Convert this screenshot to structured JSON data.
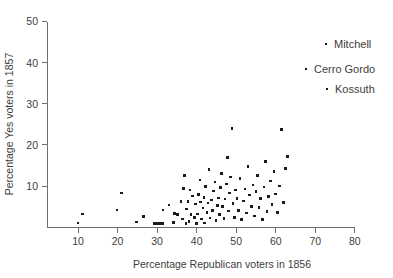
{
  "chart_data": {
    "type": "scatter",
    "title": "",
    "xlabel": "Percentage Republican voters in 1856",
    "ylabel": "Percentage Yes voters in 1857",
    "xlim": [
      5,
      80
    ],
    "ylim": [
      0,
      50
    ],
    "xticks": [
      10,
      20,
      30,
      40,
      50,
      60,
      70,
      80
    ],
    "yticks": [
      10,
      20,
      30,
      40,
      50
    ],
    "xtick_labels": [
      "10",
      "20",
      "30",
      "40",
      "50",
      "60",
      "70",
      "80"
    ],
    "ytick_labels": [
      "10",
      "20",
      "30",
      "40",
      "50"
    ],
    "grid": false,
    "legend": false,
    "marker": "square",
    "marker_color": "#1b1b1b",
    "points": [
      [
        10.0,
        1.0
      ],
      [
        11.2,
        3.2
      ],
      [
        19.9,
        4.2
      ],
      [
        21.0,
        8.3
      ],
      [
        24.8,
        1.2
      ],
      [
        26.5,
        2.6
      ],
      [
        29.4,
        0.9
      ],
      [
        30.0,
        0.9
      ],
      [
        30.6,
        0.9
      ],
      [
        31.3,
        0.9
      ],
      [
        31.5,
        4.2
      ],
      [
        33.0,
        5.4
      ],
      [
        34.2,
        1.1
      ],
      [
        34.4,
        3.3
      ],
      [
        35.2,
        3.0
      ],
      [
        36.0,
        6.2
      ],
      [
        36.4,
        2.0
      ],
      [
        36.6,
        9.4
      ],
      [
        37.0,
        12.5
      ],
      [
        37.3,
        0.9
      ],
      [
        37.5,
        4.4
      ],
      [
        37.8,
        6.3
      ],
      [
        38.1,
        1.3
      ],
      [
        38.3,
        9.0
      ],
      [
        38.6,
        3.1
      ],
      [
        38.9,
        7.6
      ],
      [
        39.4,
        2.4
      ],
      [
        39.7,
        5.6
      ],
      [
        40.0,
        0.9
      ],
      [
        40.2,
        3.2
      ],
      [
        40.5,
        8.0
      ],
      [
        40.8,
        11.5
      ],
      [
        41.0,
        6.1
      ],
      [
        41.2,
        2.0
      ],
      [
        41.6,
        4.6
      ],
      [
        41.9,
        7.2
      ],
      [
        42.0,
        1.0
      ],
      [
        42.3,
        9.9
      ],
      [
        42.6,
        3.6
      ],
      [
        42.9,
        5.9
      ],
      [
        43.1,
        14.0
      ],
      [
        43.4,
        2.2
      ],
      [
        43.7,
        6.6
      ],
      [
        44.0,
        4.0
      ],
      [
        44.3,
        8.8
      ],
      [
        44.6,
        11.0
      ],
      [
        44.9,
        1.6
      ],
      [
        45.2,
        5.2
      ],
      [
        45.5,
        7.1
      ],
      [
        45.8,
        3.0
      ],
      [
        46.0,
        9.6
      ],
      [
        46.3,
        13.0
      ],
      [
        46.6,
        5.0
      ],
      [
        46.9,
        2.1
      ],
      [
        47.2,
        6.8
      ],
      [
        47.5,
        10.5
      ],
      [
        47.8,
        17.0
      ],
      [
        48.0,
        3.9
      ],
      [
        48.3,
        8.3
      ],
      [
        48.6,
        12.2
      ],
      [
        48.9,
        24.0
      ],
      [
        49.2,
        5.7
      ],
      [
        49.5,
        2.3
      ],
      [
        49.8,
        9.0
      ],
      [
        50.2,
        7.0
      ],
      [
        50.6,
        4.1
      ],
      [
        51.0,
        11.8
      ],
      [
        51.4,
        1.9
      ],
      [
        51.8,
        6.4
      ],
      [
        52.2,
        9.3
      ],
      [
        52.6,
        3.4
      ],
      [
        53.0,
        14.8
      ],
      [
        53.4,
        7.8
      ],
      [
        53.8,
        5.0
      ],
      [
        54.2,
        10.2
      ],
      [
        54.6,
        2.7
      ],
      [
        55.0,
        8.6
      ],
      [
        55.4,
        12.6
      ],
      [
        55.8,
        4.8
      ],
      [
        56.2,
        6.9
      ],
      [
        56.6,
        1.8
      ],
      [
        57.0,
        9.8
      ],
      [
        57.4,
        16.0
      ],
      [
        57.8,
        3.8
      ],
      [
        58.2,
        7.4
      ],
      [
        58.6,
        11.2
      ],
      [
        59.0,
        5.5
      ],
      [
        59.6,
        13.6
      ],
      [
        60.0,
        8.1
      ],
      [
        60.5,
        3.5
      ],
      [
        61.0,
        10.0
      ],
      [
        61.5,
        23.8
      ],
      [
        62.0,
        6.0
      ],
      [
        62.5,
        14.2
      ],
      [
        63.0,
        17.2
      ]
    ],
    "annotations": [
      {
        "label": "Mitchell",
        "x_px": 326,
        "y_px": 44
      },
      {
        "label": "Cerro Gordo",
        "x_px": 306,
        "y_px": 69
      },
      {
        "label": "Kossuth",
        "x_px": 327,
        "y_px": 89
      }
    ],
    "annotation_points": [
      {
        "label": "Mitchell",
        "x_px": 326,
        "y_px": 44
      },
      {
        "label": "Cerro Gordo",
        "x_px": 306,
        "y_px": 69
      },
      {
        "label": "Kossuth",
        "x_px": 327,
        "y_px": 89
      }
    ]
  },
  "axes": {
    "x_axis_title": "Percentage Republican voters in 1856",
    "y_axis_title": "Percentage Yes voters in 1857"
  }
}
